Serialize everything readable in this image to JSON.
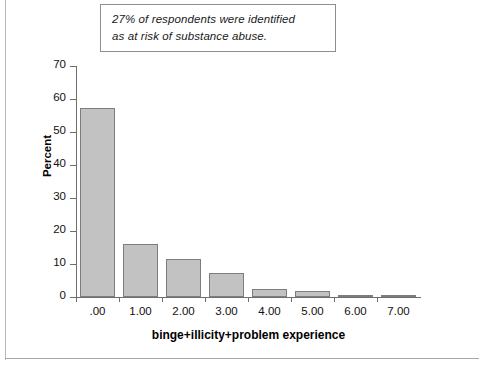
{
  "annotation": {
    "line1": "27% of respondents were identified",
    "line2": "as at risk of substance abuse."
  },
  "colors": {
    "bar_fill": "#c2c2c2",
    "bar_border": "#7d7d7d",
    "axis": "#6e6e6e",
    "text": "#111111",
    "page_rule": "#b9b9b9"
  },
  "chart_data": {
    "type": "bar",
    "title": "",
    "xlabel": "binge+illicity+problem experience",
    "ylabel": "Percent",
    "categories": [
      ".00",
      "1.00",
      "2.00",
      "3.00",
      "4.00",
      "5.00",
      "6.00",
      "7.00"
    ],
    "values": [
      57.2,
      16.2,
      11.6,
      7.4,
      2.3,
      1.7,
      0.7,
      0.5
    ],
    "ylim": [
      0,
      70
    ],
    "yticks": [
      0,
      10,
      20,
      30,
      40,
      50,
      60,
      70
    ],
    "ytick_labels": [
      "0",
      "10",
      "20",
      "30",
      "40",
      "50",
      "60",
      "70"
    ],
    "grid": false,
    "legend": "none",
    "annotations": [
      "27% of respondents were identified as at risk of substance abuse."
    ]
  }
}
